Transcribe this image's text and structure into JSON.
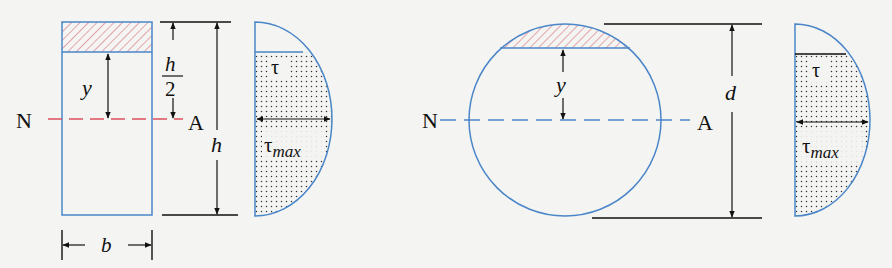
{
  "figure": {
    "type": "shear stress distribution diagrams",
    "colors": {
      "section_outline": "#4a86c8",
      "hatch": "#d9707a",
      "neutral_axis_rect": "#d9505e",
      "neutral_axis_circle": "#4a86c8",
      "dimension_lines": "#111111",
      "stipple": "#333333",
      "background": "#f4f4f2"
    }
  },
  "rectangle_section": {
    "neutral_axis": {
      "left_label": "N",
      "right_label": "A"
    },
    "labels": {
      "y": "y",
      "half_height_num": "h",
      "half_height_den": "2",
      "height": "h",
      "width": "b"
    },
    "distribution": {
      "tau": "τ",
      "tau_max_base": "τ",
      "tau_max_sub": "max"
    }
  },
  "circular_section": {
    "neutral_axis": {
      "left_label": "N",
      "right_label": "A"
    },
    "labels": {
      "y": "y",
      "diameter": "d"
    },
    "distribution": {
      "tau": "τ",
      "tau_max_base": "τ",
      "tau_max_sub": "max"
    }
  }
}
